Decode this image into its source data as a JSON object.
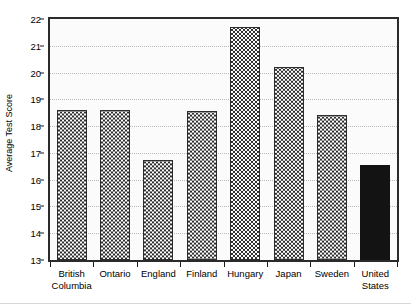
{
  "chart_data": {
    "type": "bar",
    "title": "",
    "xlabel": "",
    "ylabel": "Average Test Score",
    "ylim": [
      13,
      22
    ],
    "yticks": [
      13,
      14,
      15,
      16,
      17,
      18,
      19,
      20,
      21,
      22
    ],
    "ytick_labels": [
      "13",
      "14",
      "15",
      "16",
      "17",
      "18",
      "19",
      "20",
      "21",
      "22"
    ],
    "grid": true,
    "grid_axis": "y",
    "legend": "none",
    "categories": [
      "British\nColumbia",
      "Ontario",
      "England",
      "Finland",
      "Hungary",
      "Japan",
      "Sweden",
      "United\nStates"
    ],
    "values": [
      18.62,
      18.62,
      16.75,
      18.55,
      21.7,
      20.2,
      18.4,
      16.55
    ],
    "bar_styles": [
      "checkered",
      "checkered",
      "checkered",
      "checkered",
      "checkered",
      "checkered",
      "checkered",
      "solid"
    ],
    "highlight_category": "United States",
    "colors": {
      "bar_fill": "#f2f2f2",
      "bar_pattern": "#2d2d2d",
      "bar_edge": "#2d2d2d",
      "highlight_fill": "#131313",
      "axis": "#2b2b2b",
      "gridline": "#b9b9b9",
      "plot_background": "#fbfbfb",
      "page_background": "#ffffff",
      "text": "#000000"
    }
  }
}
